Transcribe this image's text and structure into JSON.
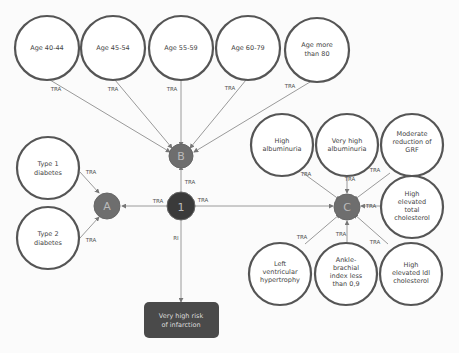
{
  "diagram": {
    "hubs": {
      "center": {
        "label": "1",
        "color": "#3a3a3a"
      },
      "a": {
        "label": "A",
        "color": "#6e6e6e"
      },
      "b": {
        "label": "B",
        "color": "#6e6e6e"
      },
      "c": {
        "label": "C",
        "color": "#6e6e6e"
      }
    },
    "age_nodes": [
      {
        "line1": "Age 40-44",
        "line2": ""
      },
      {
        "line1": "Age 45-54",
        "line2": ""
      },
      {
        "line1": "Age 55-59",
        "line2": ""
      },
      {
        "line1": "Age 60-79",
        "line2": ""
      },
      {
        "line1": "Age more",
        "line2": "than 80"
      }
    ],
    "diabetes_nodes": [
      {
        "line1": "Type 1",
        "line2": "diabetes"
      },
      {
        "line1": "Type 2",
        "line2": "diabetes"
      }
    ],
    "c_nodes": [
      {
        "lines": [
          "High",
          "albuminuria"
        ]
      },
      {
        "lines": [
          "Very high",
          "albuminuria"
        ]
      },
      {
        "lines": [
          "Moderate",
          "reduction of",
          "GRF"
        ]
      },
      {
        "lines": [
          "High",
          "elevated",
          "total",
          "cholesterol"
        ]
      },
      {
        "lines": [
          "Left",
          "ventricular",
          "hypertrophy"
        ]
      },
      {
        "lines": [
          "Ankle-",
          "brachial",
          "index less",
          "than 0,9"
        ]
      },
      {
        "lines": [
          "High",
          "elevated ldl",
          "cholesterol"
        ]
      }
    ],
    "edge_labels": {
      "tra": "TRA",
      "ri": "RI"
    },
    "outcome": {
      "line1": "Very high risk",
      "line2": "of infarction",
      "color": "#4a4a4a"
    }
  }
}
